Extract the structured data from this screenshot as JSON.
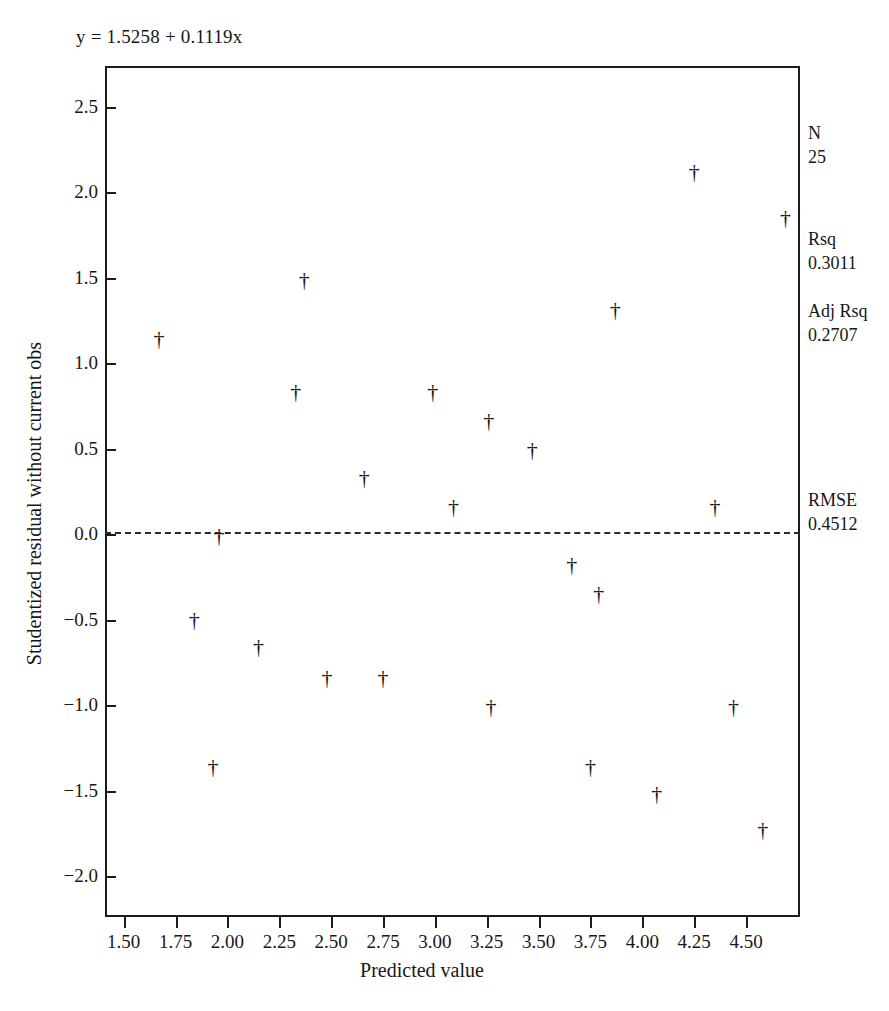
{
  "figure": {
    "equation": "y = 1.5258 + 0.1119x"
  },
  "stats": {
    "n_label": "N",
    "n_value": "25",
    "rsq_label": "Rsq",
    "rsq_value": "0.3011",
    "adj_rsq_label": "Adj Rsq",
    "adj_rsq_value": "0.2707",
    "rmse_label": "RMSE",
    "rmse_value": "0.4512"
  },
  "marker": {
    "glyph": "†"
  },
  "chart_data": {
    "type": "scatter",
    "title": "",
    "annotation": "y = 1.5258 + 0.1119x",
    "xlabel": "Predicted value",
    "ylabel": "Studentized residual without current obs",
    "xlim": [
      1.41,
      4.76
    ],
    "ylim": [
      -2.24,
      2.74
    ],
    "xticks": [
      1.5,
      1.75,
      2.0,
      2.25,
      2.5,
      2.75,
      3.0,
      3.25,
      3.5,
      3.75,
      4.0,
      4.25,
      4.5
    ],
    "xticklabels": [
      "1.50",
      "1.75",
      "2.00",
      "2.25",
      "2.50",
      "2.75",
      "3.00",
      "3.25",
      "3.50",
      "3.75",
      "4.00",
      "4.25",
      "4.50"
    ],
    "yticks": [
      2.5,
      2.0,
      1.5,
      1.0,
      0.5,
      0.0,
      -0.5,
      -1.0,
      -1.5,
      -2.0
    ],
    "yticklabels": [
      "2.5",
      "2.0",
      "1.5",
      "1.0",
      "0.5",
      "0.0",
      "−0.5",
      "−1.0",
      "−1.5",
      "−2.0"
    ],
    "grid": false,
    "legend": null,
    "reference_line": {
      "type": "horizontal",
      "y": 0.0,
      "style": "dashed"
    },
    "x": [
      1.67,
      1.84,
      1.93,
      1.96,
      2.15,
      2.33,
      2.37,
      2.48,
      2.66,
      2.75,
      2.99,
      3.0,
      3.09,
      3.26,
      3.27,
      3.47,
      3.66,
      3.75,
      3.79,
      3.87,
      4.07,
      4.25,
      4.35,
      4.44,
      4.69
    ],
    "y": [
      1.14,
      -0.5,
      -1.36,
      -0.01,
      -0.66,
      0.83,
      1.49,
      -0.84,
      0.33,
      -0.84,
      0.83,
      -1.63,
      0.16,
      0.66,
      -1.01,
      0.49,
      -0.18,
      -1.36,
      -0.35,
      1.31,
      -1.52,
      2.12,
      0.16,
      -1.01,
      1.85
    ],
    "points": [
      {
        "x": 1.67,
        "y": 1.14
      },
      {
        "x": 1.84,
        "y": -0.5
      },
      {
        "x": 1.93,
        "y": -1.36
      },
      {
        "x": 1.96,
        "y": -0.01
      },
      {
        "x": 2.15,
        "y": -0.66
      },
      {
        "x": 2.33,
        "y": 0.83
      },
      {
        "x": 2.37,
        "y": 1.49
      },
      {
        "x": 2.48,
        "y": -0.84
      },
      {
        "x": 2.66,
        "y": 0.33
      },
      {
        "x": 2.75,
        "y": -0.84
      },
      {
        "x": 2.99,
        "y": 0.83
      },
      {
        "x": 3.09,
        "y": 0.16
      },
      {
        "x": 3.26,
        "y": 0.66
      },
      {
        "x": 3.27,
        "y": -1.01
      },
      {
        "x": 3.47,
        "y": 0.49
      },
      {
        "x": 3.66,
        "y": -0.18
      },
      {
        "x": 3.75,
        "y": -1.36
      },
      {
        "x": 3.79,
        "y": -0.35
      },
      {
        "x": 3.87,
        "y": 1.31
      },
      {
        "x": 4.07,
        "y": -1.52
      },
      {
        "x": 4.25,
        "y": 2.12
      },
      {
        "x": 4.35,
        "y": 0.16
      },
      {
        "x": 4.44,
        "y": -1.01
      },
      {
        "x": 4.58,
        "y": -1.73
      },
      {
        "x": 4.69,
        "y": 1.85
      }
    ]
  }
}
